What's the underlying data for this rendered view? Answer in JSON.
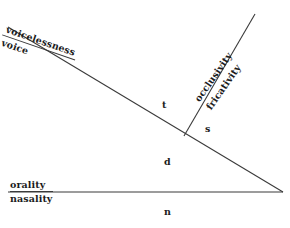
{
  "figure": {
    "type": "linguistic-feature-diagram",
    "background_color": "#ffffff",
    "line_color": "#3a3a3a",
    "text_color": "#1c1c1c"
  },
  "axes": [
    {
      "id": "voice-axis",
      "numerator": "voicelessness",
      "denominator": "voice",
      "ruled": true,
      "orientation": "descending-diagonal"
    },
    {
      "id": "occlusion-axis",
      "numerator": "occlusivity",
      "denominator": "fricativity",
      "ruled": false,
      "orientation": "rising-diagonal"
    },
    {
      "id": "orality-axis",
      "numerator": "orality",
      "denominator": "nasality",
      "ruled": true,
      "orientation": "horizontal"
    }
  ],
  "phonemes": [
    {
      "id": "t",
      "label": "t"
    },
    {
      "id": "s",
      "label": "s"
    },
    {
      "id": "d",
      "label": "d"
    },
    {
      "id": "n",
      "label": "n"
    }
  ],
  "geometry": {
    "descending_line": {
      "x1": 8,
      "y1": 27,
      "x2": 283,
      "y2": 192
    },
    "rising_line": {
      "x1": 255,
      "y1": 14,
      "x2": 184,
      "y2": 136
    },
    "horizontal_line": {
      "x1": 8,
      "y1": 192,
      "x2": 283,
      "y2": 192
    },
    "vertex": {
      "x": 283,
      "y": 192
    },
    "intersection": {
      "x": 184,
      "y": 136
    }
  }
}
